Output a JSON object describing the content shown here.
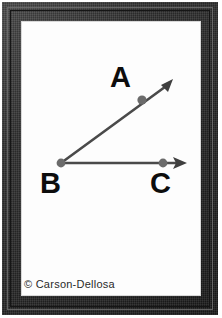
{
  "card": {
    "name": "geometry-angle-flashcard",
    "background_color": "#fdfdfd",
    "frame_color": "#2b2b2b"
  },
  "figure": {
    "type": "angle-diagram",
    "stroke_color": "#4a4a4a",
    "point_color": "#6b6b6b",
    "label_color": "#0d0d0d",
    "points": [
      {
        "id": "A",
        "label": "A",
        "x": 142,
        "y": 100,
        "label_x": 110,
        "label_y": 63
      },
      {
        "id": "B",
        "label": "B",
        "x": 61,
        "y": 163,
        "label_x": 40,
        "label_y": 169
      },
      {
        "id": "C",
        "label": "C",
        "x": 163,
        "y": 163,
        "label_x": 150,
        "label_y": 169
      }
    ],
    "rays": [
      {
        "id": "ray-BA",
        "from": "B",
        "through": "A",
        "tip_x": 173,
        "tip_y": 79
      },
      {
        "id": "ray-BC",
        "from": "B",
        "through": "C",
        "tip_x": 186,
        "tip_y": 163
      }
    ]
  },
  "footer": {
    "copyright": "© Carson-Dellosa"
  }
}
